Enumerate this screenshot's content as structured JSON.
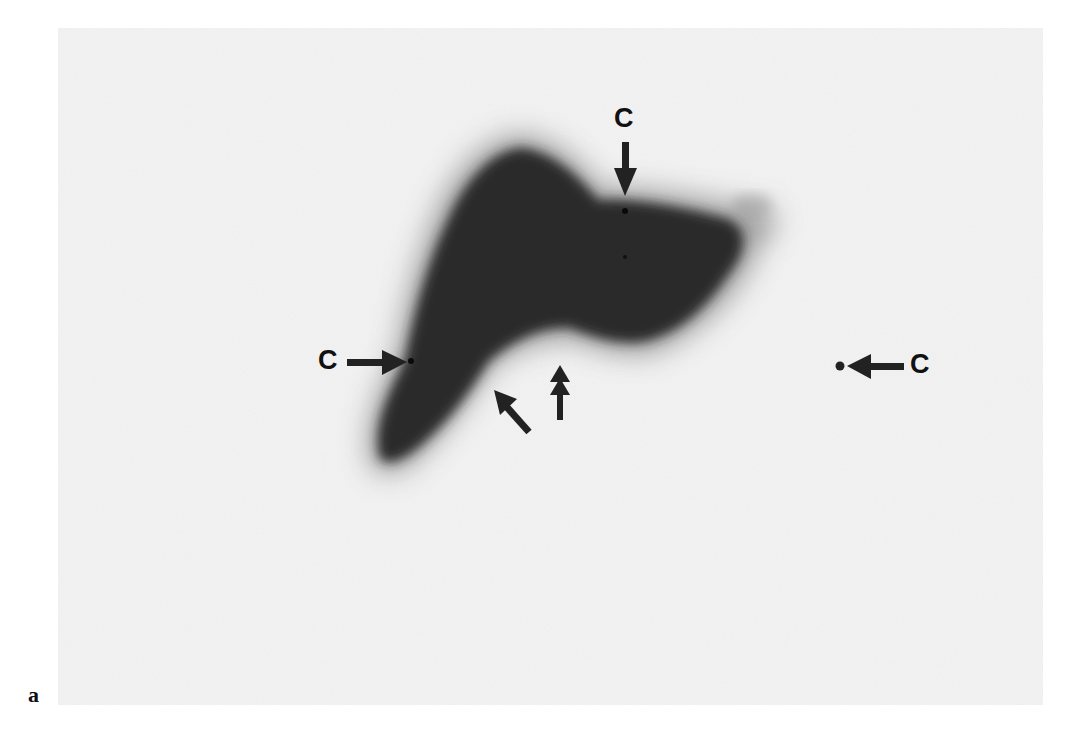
{
  "figure": {
    "panel_label": "a",
    "background_color": "#f4f4f4",
    "blob_color": "#2e2e2e",
    "markers": [
      {
        "id": "top",
        "label": "C",
        "x": 625,
        "y": 211,
        "direction": "down"
      },
      {
        "id": "left",
        "label": "C",
        "x": 411,
        "y": 361,
        "direction": "right"
      },
      {
        "id": "right",
        "label": "C",
        "x": 839,
        "y": 366,
        "direction": "left"
      }
    ],
    "unlabeled_arrows": [
      {
        "id": "single-arrow",
        "type": "single",
        "tip_x": 494,
        "tip_y": 390,
        "direction": "up-left"
      },
      {
        "id": "double-arrow",
        "type": "double",
        "tip_x": 560,
        "tip_y": 365,
        "direction": "up"
      }
    ]
  }
}
